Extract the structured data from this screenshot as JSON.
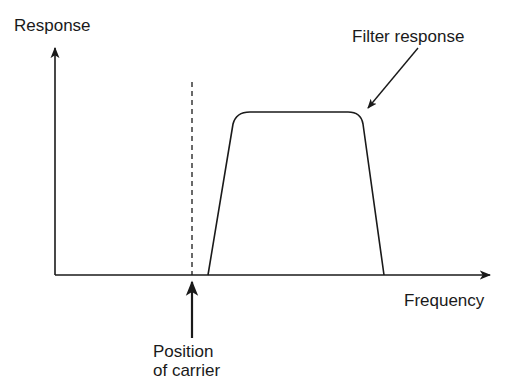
{
  "diagram": {
    "axes": {
      "y_label": "Response",
      "x_label": "Frequency"
    },
    "annotations": {
      "filter_response": "Filter response",
      "carrier_line1": "Position",
      "carrier_line2": "of carrier"
    },
    "colors": {
      "line": "#1a1a1a",
      "background": "#ffffff"
    }
  }
}
